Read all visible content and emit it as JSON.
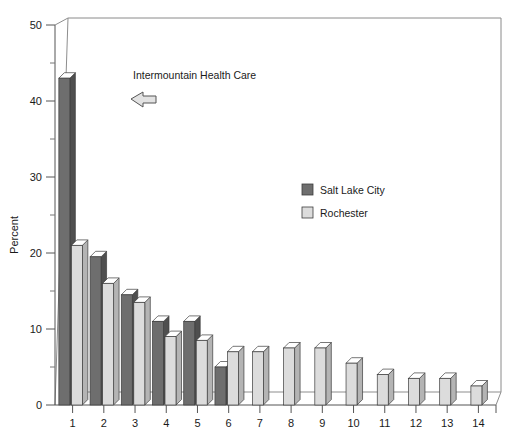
{
  "chart_data": {
    "type": "bar",
    "title": "",
    "subtitle": "",
    "xlabel": "",
    "ylabel": "Percent",
    "categories": [
      "1",
      "2",
      "3",
      "4",
      "5",
      "6",
      "7",
      "8",
      "9",
      "10",
      "11",
      "12",
      "13",
      "14"
    ],
    "series": [
      {
        "name": "Salt Lake City",
        "color": "#6e6e6e",
        "values": [
          43,
          19.5,
          14.5,
          11,
          11,
          5,
          null,
          null,
          null,
          null,
          null,
          null,
          null,
          null
        ]
      },
      {
        "name": "Rochester",
        "color": "#dcdcdc",
        "values": [
          21,
          16,
          13.5,
          9,
          8.5,
          7,
          7,
          7.5,
          7.5,
          5.5,
          4,
          3.5,
          3.5,
          2.5
        ]
      }
    ],
    "ylim": [
      0,
      50
    ],
    "y_major_ticks": [
      0,
      10,
      20,
      30,
      40,
      50
    ],
    "y_minor_ticks": [
      5,
      15,
      25,
      35,
      45
    ],
    "y_tick_labels": [
      "0",
      "10",
      "20",
      "30",
      "40",
      "50"
    ],
    "grid": false,
    "legend_position": "center-right",
    "style": "3d-bars",
    "annotations": [
      {
        "text": "Intermountain Health Care",
        "arrow": "left-arrow",
        "points_to_category": "1"
      }
    ]
  },
  "legend": {
    "entries": [
      {
        "label": "Salt Lake City",
        "color": "#6e6e6e"
      },
      {
        "label": "Rochester",
        "color": "#dcdcdc"
      }
    ]
  },
  "axes": {
    "y_title": "Percent",
    "y_labels": [
      "50",
      "40",
      "30",
      "20",
      "10",
      "0"
    ],
    "x_labels": [
      "1",
      "2",
      "3",
      "4",
      "5",
      "6",
      "7",
      "8",
      "9",
      "10",
      "11",
      "12",
      "13",
      "14"
    ]
  },
  "annotation": {
    "text": "Intermountain Health Care"
  },
  "colors": {
    "series_dark": "#6e6e6e",
    "series_light": "#dcdcdc",
    "dark_side": "#4f4f4f",
    "light_side": "#b4b4b4",
    "dark_top": "#ffffff",
    "light_top": "#ffffff",
    "axis": "#555555",
    "frame": "#8a8a8a"
  }
}
